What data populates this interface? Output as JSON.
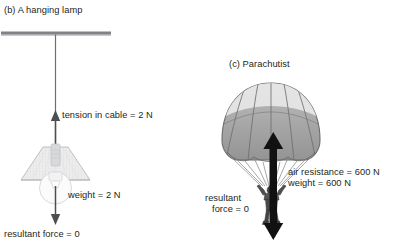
{
  "figure": {
    "panel_b": {
      "title": "(b) A hanging lamp",
      "tension_label": "tension in cable = 2 N",
      "weight_label": "weight = 2 N",
      "resultant_label": "resultant force = 0",
      "ceiling_color": "#808285",
      "cable_color": "#6d6e71",
      "shade_fill": "#ededee",
      "shade_stroke": "#a7a9ac",
      "arrow_color": "#58595b"
    },
    "panel_c": {
      "title": "(c) Parachutist",
      "air_resistance_label": "air resistance = 600 N",
      "weight_label": "weight = 600 N",
      "resultant_line_1": "resultant",
      "resultant_line_2": "force = 0",
      "canopy_top_fill": "#e8e8e8",
      "canopy_body_fill": "#9a9a9a",
      "canopy_stroke": "#6b6b6b",
      "lines_color": "#808080",
      "figure_color": "#4a4a4a",
      "arrow_color": "#111111"
    }
  }
}
